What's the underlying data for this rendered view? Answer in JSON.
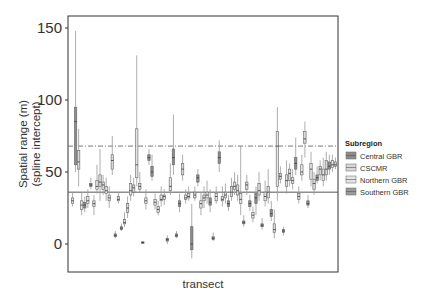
{
  "chart_data": {
    "type": "boxplot",
    "title": "",
    "xlabel": "transect",
    "ylabel_line1": "Spatial range (m)",
    "ylabel_line2": "(spline intercept)",
    "ylim": [
      -18,
      158
    ],
    "yticks": [
      0,
      50,
      100,
      150
    ],
    "ytick_labels": [
      "0",
      "50",
      "100",
      "150"
    ],
    "grid": false,
    "reference_lines": [
      {
        "style": "solid",
        "y": 36
      },
      {
        "style": "dashdot",
        "y": 68
      }
    ],
    "legend": {
      "title": "Subregion",
      "position": "right",
      "entries": [
        {
          "label": "Central GBR",
          "fill": "#8c8c8c"
        },
        {
          "label": "CSCMR",
          "fill": "#d9d9d9"
        },
        {
          "label": "Northern GBR",
          "fill": "#e4e4e4"
        },
        {
          "label": "Southern GBR",
          "fill": "#9a9a9a"
        }
      ]
    },
    "note": "Approximate values per transect box (min, q1, median, q3, max, group index into legend entries), read from the figure.",
    "boxes": [
      [
        26,
        28,
        30,
        32,
        36,
        2
      ],
      [
        50,
        55,
        85,
        95,
        148,
        0
      ],
      [
        40,
        52,
        57,
        65,
        80,
        1
      ],
      [
        20,
        24,
        27,
        30,
        36,
        2
      ],
      [
        22,
        25,
        27,
        29,
        33,
        0
      ],
      [
        25,
        28,
        30,
        33,
        38,
        2
      ],
      [
        38,
        40,
        41,
        42,
        46,
        0
      ],
      [
        20,
        26,
        28,
        30,
        34,
        1
      ],
      [
        35,
        38,
        40,
        44,
        55,
        2
      ],
      [
        30,
        40,
        43,
        48,
        66,
        1
      ],
      [
        34,
        38,
        41,
        43,
        48,
        1
      ],
      [
        30,
        35,
        37,
        40,
        46,
        2
      ],
      [
        25,
        30,
        32,
        34,
        40,
        2
      ],
      [
        48,
        52,
        58,
        62,
        75,
        1
      ],
      [
        4,
        5,
        6,
        7,
        9,
        0
      ],
      [
        28,
        30,
        31,
        33,
        36,
        1
      ],
      [
        9,
        10,
        11,
        12,
        14,
        0
      ],
      [
        12,
        14,
        15,
        17,
        22,
        2
      ],
      [
        18,
        22,
        25,
        28,
        33,
        1
      ],
      [
        30,
        34,
        37,
        42,
        48,
        2
      ],
      [
        33,
        36,
        39,
        41,
        46,
        1
      ],
      [
        40,
        46,
        55,
        80,
        131,
        2
      ],
      [
        36,
        38,
        40,
        42,
        50,
        1
      ],
      [
        0,
        0.5,
        1,
        1.5,
        2,
        0
      ],
      [
        24,
        28,
        30,
        32,
        38,
        2
      ],
      [
        55,
        58,
        60,
        62,
        66,
        0
      ],
      [
        44,
        47,
        50,
        54,
        62,
        0
      ],
      [
        24,
        27,
        29,
        31,
        35,
        2
      ],
      [
        20,
        22,
        24,
        26,
        30,
        1
      ],
      [
        26,
        30,
        31,
        34,
        40,
        2
      ],
      [
        27,
        31,
        33,
        34,
        38,
        1
      ],
      [
        0,
        2,
        3,
        4,
        6,
        0
      ],
      [
        34,
        37,
        40,
        46,
        56,
        2
      ],
      [
        48,
        55,
        60,
        66,
        90,
        0
      ],
      [
        4,
        5,
        6,
        7,
        9,
        0
      ],
      [
        22,
        26,
        28,
        30,
        35,
        0
      ],
      [
        44,
        48,
        52,
        56,
        62,
        1
      ],
      [
        28,
        31,
        32,
        34,
        38,
        2
      ],
      [
        30,
        32,
        33,
        35,
        40,
        1
      ],
      [
        -10,
        -4,
        0,
        12,
        28,
        0
      ],
      [
        30,
        32,
        34,
        36,
        40,
        1
      ],
      [
        40,
        43,
        46,
        48,
        52,
        0
      ],
      [
        20,
        25,
        28,
        30,
        36,
        2
      ],
      [
        25,
        30,
        32,
        34,
        40,
        1
      ],
      [
        28,
        32,
        34,
        36,
        44,
        2
      ],
      [
        22,
        27,
        29,
        32,
        38,
        0
      ],
      [
        2,
        3,
        4,
        5,
        8,
        0
      ],
      [
        28,
        30,
        33,
        35,
        40,
        2
      ],
      [
        50,
        56,
        60,
        64,
        72,
        0
      ],
      [
        26,
        30,
        31,
        33,
        40,
        1
      ],
      [
        28,
        32,
        34,
        36,
        42,
        2
      ],
      [
        23,
        26,
        28,
        30,
        34,
        0
      ],
      [
        30,
        33,
        36,
        40,
        46,
        1
      ],
      [
        34,
        38,
        40,
        43,
        50,
        2
      ],
      [
        30,
        34,
        37,
        41,
        48,
        1
      ],
      [
        20,
        28,
        31,
        35,
        68,
        2
      ],
      [
        12,
        14,
        15,
        16,
        20,
        0
      ],
      [
        34,
        38,
        41,
        43,
        48,
        1
      ],
      [
        23,
        26,
        28,
        30,
        34,
        0
      ],
      [
        15,
        18,
        20,
        22,
        26,
        2
      ],
      [
        20,
        28,
        32,
        35,
        40,
        0
      ],
      [
        30,
        34,
        37,
        42,
        50,
        1
      ],
      [
        10,
        12,
        13,
        14,
        18,
        0
      ],
      [
        26,
        30,
        33,
        36,
        44,
        2
      ],
      [
        28,
        32,
        36,
        40,
        52,
        1
      ],
      [
        16,
        19,
        21,
        24,
        30,
        0
      ],
      [
        4,
        8,
        10,
        14,
        24,
        1
      ],
      [
        30,
        40,
        68,
        78,
        95,
        2
      ],
      [
        42,
        45,
        47,
        49,
        54,
        1
      ],
      [
        6,
        8,
        9,
        10,
        12,
        0
      ],
      [
        35,
        40,
        44,
        48,
        58,
        2
      ],
      [
        40,
        44,
        49,
        52,
        56,
        1
      ],
      [
        38,
        42,
        44,
        46,
        52,
        2
      ],
      [
        48,
        52,
        56,
        60,
        74,
        0
      ],
      [
        28,
        31,
        33,
        35,
        40,
        1
      ],
      [
        44,
        48,
        50,
        55,
        62,
        2
      ],
      [
        60,
        70,
        73,
        78,
        85,
        1
      ],
      [
        25,
        27,
        28,
        30,
        34,
        0
      ],
      [
        40,
        45,
        52,
        56,
        64,
        2
      ],
      [
        34,
        38,
        42,
        45,
        50,
        1
      ],
      [
        42,
        44,
        46,
        48,
        54,
        0
      ],
      [
        44,
        48,
        52,
        54,
        58,
        1
      ],
      [
        40,
        44,
        48,
        52,
        60,
        2
      ],
      [
        44,
        48,
        52,
        58,
        64,
        1
      ],
      [
        48,
        52,
        54,
        57,
        62,
        0
      ],
      [
        50,
        53,
        55,
        58,
        62,
        2
      ],
      [
        52,
        54,
        55,
        57,
        60,
        1
      ]
    ]
  }
}
